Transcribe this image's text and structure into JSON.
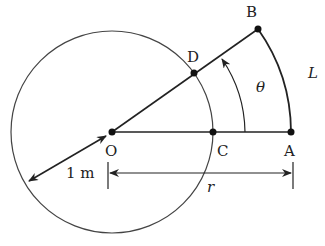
{
  "diagram": {
    "points": {
      "O": {
        "label": "O",
        "x": 112,
        "y": 132
      },
      "C": {
        "label": "C",
        "x": 213,
        "y": 132
      },
      "A": {
        "label": "A",
        "x": 291,
        "y": 132
      },
      "D": {
        "label": "D",
        "x": 194,
        "y": 73
      },
      "B": {
        "label": "B",
        "x": 258,
        "y": 29
      }
    },
    "labels": {
      "theta": "θ",
      "arc_length": "L",
      "radius_r": "r",
      "unit_radius": "1 m"
    },
    "colors": {
      "stroke": "#222222",
      "circle": "#444444",
      "background": "#ffffff"
    }
  }
}
